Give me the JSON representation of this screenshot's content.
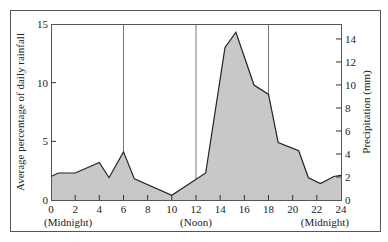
{
  "chart_data": {
    "type": "area",
    "title": "",
    "xlabel": "",
    "ylabel": "Average percentage of daily rainfall",
    "ylabel_right": "Precipitation (mm)",
    "xlim": [
      0,
      24
    ],
    "ylim": [
      0,
      15
    ],
    "ylim_right": [
      0,
      15.3
    ],
    "x_ticks": [
      0,
      2,
      4,
      6,
      8,
      10,
      12,
      14,
      16,
      18,
      20,
      22,
      24
    ],
    "y_ticks": [
      0,
      5,
      10,
      15
    ],
    "y_ticks_right": [
      0,
      2,
      4,
      6,
      8,
      10,
      12,
      14
    ],
    "x_annotations": [
      {
        "x": 0,
        "label": "(Midnight)"
      },
      {
        "x": 12,
        "label": "(Noon)"
      },
      {
        "x": 24,
        "label": "(Midnight)"
      }
    ],
    "vertical_gridlines": [
      6,
      12,
      18
    ],
    "fill_color": "#c8c8c8",
    "line_color": "#222222",
    "series": [
      {
        "name": "Average percentage of daily rainfall",
        "x": [
          0,
          0.6,
          2,
          4,
          4.8,
          6,
          6.9,
          10,
          12.8,
          14.4,
          15.3,
          16.8,
          18,
          18.8,
          20.5,
          21.3,
          22.3,
          23.4,
          24
        ],
        "values": [
          2.0,
          2.3,
          2.3,
          3.2,
          1.9,
          4.1,
          1.8,
          0.4,
          2.3,
          13.0,
          14.3,
          9.8,
          9.0,
          4.9,
          4.2,
          1.9,
          1.4,
          2.0,
          2.1
        ]
      }
    ]
  }
}
